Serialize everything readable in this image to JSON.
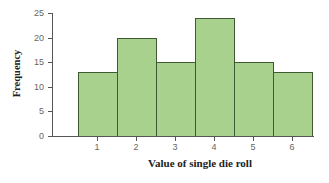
{
  "chart_data": {
    "type": "bar",
    "title": "",
    "xlabel": "Value of single die roll",
    "ylabel": "Frequency",
    "categories": [
      "1",
      "2",
      "3",
      "4",
      "5",
      "6"
    ],
    "values": [
      13,
      20,
      15,
      24,
      15,
      13
    ],
    "ylim": [
      0,
      25
    ],
    "yticks": [
      "0",
      "5",
      "10",
      "15",
      "20",
      "25"
    ],
    "grid": false,
    "legend": null,
    "bar_color": "#a9d18e",
    "bar_edge_color": "#3d5a32"
  }
}
